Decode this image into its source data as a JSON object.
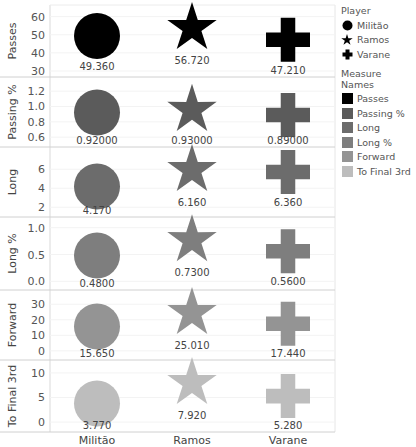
{
  "chart_data": {
    "type": "scatter",
    "title": "",
    "xlabel": "",
    "categories": [
      "Militão",
      "Ramos",
      "Varane"
    ],
    "rows": [
      {
        "measure": "Passes",
        "ylabel": "Passes",
        "color": "#000000",
        "ylim": [
          30,
          62
        ],
        "ticks": [
          30,
          40,
          50,
          60
        ],
        "tick_labels": [
          "30",
          "40",
          "50",
          "60"
        ],
        "values": [
          49.36,
          56.72,
          47.21
        ],
        "labels": [
          "49.360",
          "56.720",
          "47.210"
        ]
      },
      {
        "measure": "Passing %",
        "ylabel": "Passing %",
        "color": "#5b5b5b",
        "ylim": [
          0.55,
          1.28
        ],
        "ticks": [
          0.6,
          0.8,
          1.0,
          1.2
        ],
        "tick_labels": [
          "0.6",
          "0.8",
          "1.0",
          "1.2"
        ],
        "values": [
          0.92,
          0.93,
          0.89
        ],
        "labels": [
          "0.92000",
          "0.93000",
          "0.89000"
        ]
      },
      {
        "measure": "Long",
        "ylabel": "Long",
        "color": "#6c6c6c",
        "ylim": [
          1.6,
          7.5
        ],
        "ticks": [
          2,
          4,
          6
        ],
        "tick_labels": [
          "2",
          "4",
          "6"
        ],
        "values": [
          4.17,
          6.16,
          6.36
        ],
        "labels": [
          "4.170",
          "6.160",
          "6.360"
        ]
      },
      {
        "measure": "Long %",
        "ylabel": "Long %",
        "color": "#7e7e7e",
        "ylim": [
          -0.05,
          1.05
        ],
        "ticks": [
          0.0,
          0.5,
          1.0
        ],
        "tick_labels": [
          "0.0",
          "0.5",
          "1.0"
        ],
        "values": [
          0.48,
          0.73,
          0.56
        ],
        "labels": [
          "0.4800",
          "0.7300",
          "0.5600"
        ]
      },
      {
        "measure": "Forward",
        "ylabel": "Forward",
        "color": "#949494",
        "ylim": [
          -2,
          34
        ],
        "ticks": [
          0,
          10,
          20,
          30
        ],
        "tick_labels": [
          "0",
          "10",
          "20",
          "30"
        ],
        "values": [
          15.65,
          25.01,
          17.44
        ],
        "labels": [
          "15.650",
          "25.010",
          "17.440"
        ]
      },
      {
        "measure": "To Final 3rd",
        "ylabel": "To Final 3rd",
        "color": "#bdbdbd",
        "ylim": [
          -0.8,
          11
        ],
        "ticks": [
          0,
          5,
          10
        ],
        "tick_labels": [
          "0",
          "5",
          "10"
        ],
        "values": [
          3.77,
          7.92,
          5.28
        ],
        "labels": [
          "3.770",
          "7.920",
          "5.280"
        ]
      }
    ],
    "legend": {
      "position": "right",
      "player_title": "Player",
      "players": [
        {
          "name": "Militão",
          "shape": "circle"
        },
        {
          "name": "Ramos",
          "shape": "star"
        },
        {
          "name": "Varane",
          "shape": "cross"
        }
      ],
      "measure_title": "Measure Names",
      "measures": [
        {
          "name": "Passes",
          "color": "#000000"
        },
        {
          "name": "Passing %",
          "color": "#5b5b5b"
        },
        {
          "name": "Long",
          "color": "#6c6c6c"
        },
        {
          "name": "Long %",
          "color": "#7e7e7e"
        },
        {
          "name": "Forward",
          "color": "#949494"
        },
        {
          "name": "To Final 3rd",
          "color": "#bdbdbd"
        }
      ]
    },
    "grid": true
  }
}
